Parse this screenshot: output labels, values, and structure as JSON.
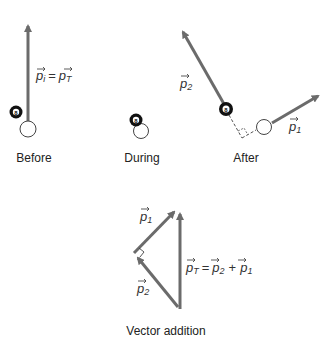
{
  "panels": {
    "before": {
      "caption": "Before",
      "equation": {
        "left": "p",
        "left_sub": "i",
        "eq": "=",
        "right": "p",
        "right_sub": "T"
      }
    },
    "during": {
      "caption": "During"
    },
    "after": {
      "caption": "After",
      "p2": {
        "sym": "p",
        "sub": "2"
      },
      "p1": {
        "sym": "p",
        "sub": "1"
      }
    },
    "vector_addition": {
      "caption": "Vector addition",
      "p1": {
        "sym": "p",
        "sub": "1"
      },
      "p2": {
        "sym": "p",
        "sub": "2"
      },
      "sum": {
        "lhs": "p",
        "lhs_sub": "T",
        "eq": "=",
        "a": "p",
        "a_sub": "2",
        "plus": "+",
        "b": "p",
        "b_sub": "1"
      }
    }
  },
  "ball_label": "8",
  "colors": {
    "arrow": "#6b6b6b",
    "eight_ball": "#111111",
    "cue_ball_stroke": "#444444"
  }
}
